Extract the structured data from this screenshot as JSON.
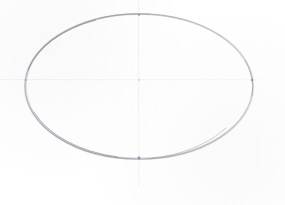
{
  "document": {
    "title": "Ellipse construction sketch",
    "medium": "graphite pencil on white paper",
    "canvas": {
      "width": 285,
      "height": 205,
      "background_color": "#ffffff"
    }
  },
  "palette": {
    "paper": "#ffffff",
    "pencil_dark": "#8f8f98",
    "pencil_mid": "#b4b4bd",
    "pencil_light": "#d6d6dc",
    "guide_line": "#dcdce1",
    "guide_line_faint": "#e9e9ee"
  },
  "drawing": {
    "shapes": [
      {
        "name": "ellipse-outline",
        "type": "ellipse",
        "center_x": 139,
        "center_y": 86.5,
        "radius_x": 114,
        "radius_y": 72.5,
        "left_x": 25,
        "right_x": 253,
        "top_y": 14,
        "bottom_y": 159,
        "stroke_color": "#a9a9b2",
        "stroke_width": 0.9,
        "fill": "none"
      },
      {
        "name": "vertical-guide-axis",
        "type": "line",
        "x1": 139,
        "y1": 0,
        "x2": 139,
        "y2": 191,
        "stroke_color": "#dcdce1",
        "stroke_width": 1
      },
      {
        "name": "horizontal-guide-axis",
        "type": "line",
        "x1": 0,
        "y1": 80,
        "x2": 265,
        "y2": 80,
        "stroke_color": "#e3e3e8",
        "stroke_width": 1
      }
    ],
    "crosshair": {
      "name": "axis-intersection",
      "x": 139,
      "y": 80
    },
    "tangent_marks": [
      {
        "name": "top-tangent-mark",
        "x": 139,
        "y": 15
      },
      {
        "name": "bottom-tangent-mark",
        "x": 139,
        "y": 158
      },
      {
        "name": "left-tangent-mark",
        "x": 26,
        "y": 80
      },
      {
        "name": "right-tangent-mark",
        "x": 252,
        "y": 80
      }
    ]
  }
}
